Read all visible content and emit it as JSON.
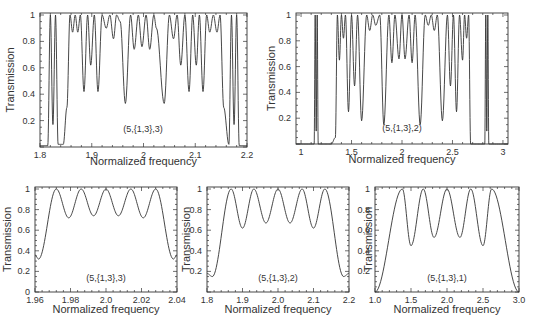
{
  "chart_data": [
    {
      "id": "top-left",
      "type": "line",
      "title": "",
      "annotation": "(5,{1,3},3)",
      "xlabel": "Normalized frequency",
      "ylabel": "Transmission",
      "xlim": [
        1.8,
        2.2
      ],
      "ylim": [
        0,
        1
      ],
      "xticks": [
        1.8,
        1.9,
        2,
        2.1,
        2.2
      ],
      "xtick_labels": [
        "1.8",
        "1.9",
        "2",
        "2.1",
        "2.2"
      ],
      "yticks": [
        0.2,
        0.4,
        0.6,
        0.8,
        1
      ],
      "ytick_labels": [
        "0.2",
        "0.4",
        "0.6",
        "0.8",
        "1"
      ],
      "grid": false,
      "band_edges": [
        1.855,
        2.145
      ],
      "x": [
        1.8,
        1.815,
        1.82,
        1.825,
        1.83,
        1.835,
        1.845,
        1.852,
        1.858,
        1.863,
        1.868,
        1.873,
        1.878,
        1.885,
        1.892,
        1.898,
        1.905,
        1.912,
        1.92,
        1.928,
        1.935,
        1.942,
        1.948,
        1.955,
        1.965,
        1.975,
        1.982,
        1.99,
        1.997,
        2.005,
        2.012,
        2.02,
        2.025,
        2.04,
        2.05,
        2.058,
        2.065,
        2.072,
        2.08,
        2.088,
        2.095,
        2.102,
        2.108,
        2.115,
        2.122,
        2.128,
        2.135,
        2.142,
        2.148,
        2.155,
        2.165,
        2.17,
        2.175,
        2.18,
        2.185,
        2.2
      ],
      "y": [
        0.01,
        0.01,
        1.0,
        0.17,
        1.0,
        0.02,
        0.02,
        0.3,
        1.0,
        0.87,
        1.0,
        0.87,
        1.0,
        0.42,
        1.0,
        0.62,
        1.0,
        0.42,
        1.0,
        0.9,
        1.0,
        0.82,
        1.0,
        0.95,
        0.33,
        1.0,
        0.74,
        1.0,
        0.76,
        1.0,
        0.74,
        1.0,
        0.9,
        0.33,
        1.0,
        0.82,
        1.0,
        0.62,
        1.0,
        0.42,
        1.0,
        0.62,
        1.0,
        0.42,
        1.0,
        0.87,
        1.0,
        0.87,
        1.0,
        0.3,
        0.02,
        1.0,
        0.17,
        1.0,
        0.01,
        0.01
      ]
    },
    {
      "id": "top-right",
      "type": "line",
      "title": "",
      "annotation": "(5,{1,3},2)",
      "xlabel": "Normalized frequency",
      "ylabel": "Transmission",
      "xlim": [
        0.95,
        3.05
      ],
      "ylim": [
        0,
        1
      ],
      "xticks": [
        1,
        1.5,
        2,
        2.5,
        3
      ],
      "xtick_labels": [
        "1",
        "1.5",
        "2",
        "2.5",
        "3"
      ],
      "yticks": [
        0.2,
        0.4,
        0.6,
        0.8,
        1
      ],
      "ytick_labels": [
        "0.2",
        "0.4",
        "0.6",
        "0.8",
        "1"
      ],
      "grid": false,
      "x": [
        0.95,
        1.13,
        1.14,
        1.15,
        1.16,
        1.17,
        1.3,
        1.34,
        1.36,
        1.38,
        1.4,
        1.42,
        1.44,
        1.47,
        1.5,
        1.53,
        1.56,
        1.6,
        1.65,
        1.68,
        1.71,
        1.74,
        1.78,
        1.82,
        1.87,
        1.9,
        1.93,
        1.97,
        2.0,
        2.03,
        2.07,
        2.1,
        2.13,
        2.18,
        2.23,
        2.26,
        2.29,
        2.32,
        2.35,
        2.4,
        2.45,
        2.48,
        2.51,
        2.54,
        2.57,
        2.6,
        2.62,
        2.64,
        2.66,
        2.68,
        2.82,
        2.83,
        2.84,
        2.85,
        2.86,
        3.05
      ],
      "y": [
        0.0,
        0.0,
        1.0,
        0.1,
        1.0,
        0.0,
        0.0,
        0.05,
        1.0,
        0.65,
        1.0,
        0.82,
        1.0,
        0.25,
        1.0,
        0.45,
        1.0,
        0.18,
        1.0,
        0.88,
        1.0,
        0.92,
        1.0,
        0.15,
        1.0,
        0.63,
        1.0,
        0.66,
        1.0,
        0.66,
        1.0,
        0.63,
        1.0,
        0.15,
        1.0,
        0.92,
        1.0,
        0.88,
        1.0,
        0.18,
        1.0,
        0.45,
        1.0,
        0.25,
        1.0,
        0.65,
        1.0,
        0.82,
        1.0,
        0.0,
        0.0,
        1.0,
        0.1,
        1.0,
        0.0,
        0.0
      ]
    },
    {
      "id": "bottom-left",
      "type": "line",
      "title": "",
      "annotation": "(5,{1,3},3)",
      "xlabel": "Normalized frequency",
      "ylabel": "Transmission",
      "xlim": [
        1.96,
        2.04
      ],
      "ylim": [
        0,
        1
      ],
      "xticks": [
        1.96,
        1.98,
        2.0,
        2.02,
        2.04
      ],
      "xtick_labels": [
        "1.96",
        "1.98",
        "2.0",
        "2.02",
        "2.04"
      ],
      "yticks": [
        0,
        0.2,
        0.4,
        0.6,
        0.8,
        1
      ],
      "ytick_labels": [
        "0",
        "0.2",
        "0.4",
        "0.6",
        "0.8",
        "1"
      ],
      "grid": false,
      "peaks": [
        1.972,
        1.986,
        2.0,
        2.014,
        2.028
      ],
      "minima": [
        {
          "x": 1.962,
          "y": 0.32
        },
        {
          "x": 1.979,
          "y": 0.72
        },
        {
          "x": 1.993,
          "y": 0.74
        },
        {
          "x": 2.007,
          "y": 0.74
        },
        {
          "x": 2.021,
          "y": 0.72
        },
        {
          "x": 2.038,
          "y": 0.32
        }
      ],
      "edge_values": [
        0.36,
        0.36
      ]
    },
    {
      "id": "bottom-middle",
      "type": "line",
      "title": "",
      "annotation": "(5,{1,3},2)",
      "xlabel": "Normalized frequency",
      "ylabel": "Transmission",
      "xlim": [
        1.8,
        2.2
      ],
      "ylim": [
        0,
        1
      ],
      "xticks": [
        1.8,
        1.9,
        2.0,
        2.1,
        2.2
      ],
      "xtick_labels": [
        "1.8",
        "1.9",
        "2.0",
        "2.1",
        "2.2"
      ],
      "yticks": [
        0.2,
        0.4,
        0.6,
        0.8,
        1
      ],
      "ytick_labels": [
        "0.2",
        "0.4",
        "0.6",
        "0.8",
        "1"
      ],
      "grid": false,
      "peaks": [
        1.868,
        1.932,
        2.0,
        2.068,
        2.132
      ],
      "minima": [
        {
          "x": 1.815,
          "y": 0.15
        },
        {
          "x": 1.9,
          "y": 0.62
        },
        {
          "x": 1.966,
          "y": 0.67
        },
        {
          "x": 2.034,
          "y": 0.67
        },
        {
          "x": 2.1,
          "y": 0.62
        },
        {
          "x": 2.185,
          "y": 0.15
        }
      ],
      "edge_values": [
        0.18,
        0.18
      ]
    },
    {
      "id": "bottom-right",
      "type": "line",
      "title": "",
      "annotation": "(5,{1,3},1)",
      "xlabel": "Normalized frequency",
      "ylabel": "Transmission",
      "xlim": [
        1.0,
        3.0
      ],
      "ylim": [
        0,
        1
      ],
      "xticks": [
        1.0,
        1.5,
        2.0,
        2.5,
        3.0
      ],
      "xtick_labels": [
        "1.0",
        "1.5",
        "2.0",
        "2.5",
        "3.0"
      ],
      "yticks": [
        0.2,
        0.4,
        0.6,
        0.8,
        1
      ],
      "ytick_labels": [
        "0.2",
        "0.4",
        "0.6",
        "0.8",
        "1"
      ],
      "grid": false,
      "peaks": [
        1.38,
        1.67,
        2.0,
        2.33,
        2.62
      ],
      "minima": [
        {
          "x": 1.0,
          "y": 0.0
        },
        {
          "x": 1.5,
          "y": 0.45
        },
        {
          "x": 1.82,
          "y": 0.53
        },
        {
          "x": 2.18,
          "y": 0.53
        },
        {
          "x": 2.5,
          "y": 0.45
        },
        {
          "x": 3.0,
          "y": 0.0
        }
      ],
      "edge_values": [
        0.0,
        0.0
      ]
    }
  ]
}
